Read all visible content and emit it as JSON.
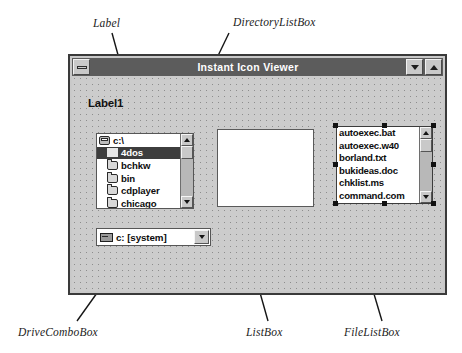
{
  "annotations": [
    {
      "key": "label",
      "text": "Label"
    },
    {
      "key": "directorylistbox",
      "text": "DirectoryListBox"
    },
    {
      "key": "drivecombobox",
      "text": "DriveComboBox"
    },
    {
      "key": "listbox",
      "text": "ListBox"
    },
    {
      "key": "filelistbox",
      "text": "FileListBox"
    }
  ],
  "window": {
    "title": "Instant Icon Viewer",
    "system_menu_icon": "minimize-bar-icon",
    "minimize_icon": "arrow-down-icon",
    "maximize_icon": "arrow-up-icon"
  },
  "form": {
    "label1": "Label1",
    "directory_list": {
      "items": [
        {
          "text": "c:\\",
          "icon": "folder-open-icon",
          "selected": false,
          "indent": false
        },
        {
          "text": "4dos",
          "icon": "folder-icon",
          "selected": true,
          "indent": true
        },
        {
          "text": "bchkw",
          "icon": "folder-icon",
          "selected": false,
          "indent": true
        },
        {
          "text": "bin",
          "icon": "folder-icon",
          "selected": false,
          "indent": true
        },
        {
          "text": "cdplayer",
          "icon": "folder-icon",
          "selected": false,
          "indent": true
        },
        {
          "text": "chicago",
          "icon": "folder-icon",
          "selected": false,
          "indent": true
        }
      ],
      "scrollbar": {
        "up_icon": "scroll-up-arrow-icon",
        "down_icon": "scroll-down-arrow-icon"
      }
    },
    "list_box": {
      "items": []
    },
    "file_list": {
      "items": [
        "autoexec.bat",
        "autoexec.w40",
        "borland.txt",
        "bukideas.doc",
        "chklist.ms",
        "command.com"
      ],
      "scrollbar": {
        "up_icon": "scroll-up-arrow-icon",
        "down_icon": "scroll-down-arrow-icon"
      },
      "selected_in_designer": true
    },
    "drive_combo": {
      "value": "c: [system]",
      "icon": "drive-icon",
      "dropdown_icon": "chevron-down-icon"
    }
  },
  "colors": {
    "form_face": "#cccccc",
    "titlebar": "#5c5c5c",
    "titlebar_text": "#ffffff",
    "control_face": "#c9c9c9",
    "selection": "#3d3d3d",
    "window_border": "#3a3a3a"
  }
}
